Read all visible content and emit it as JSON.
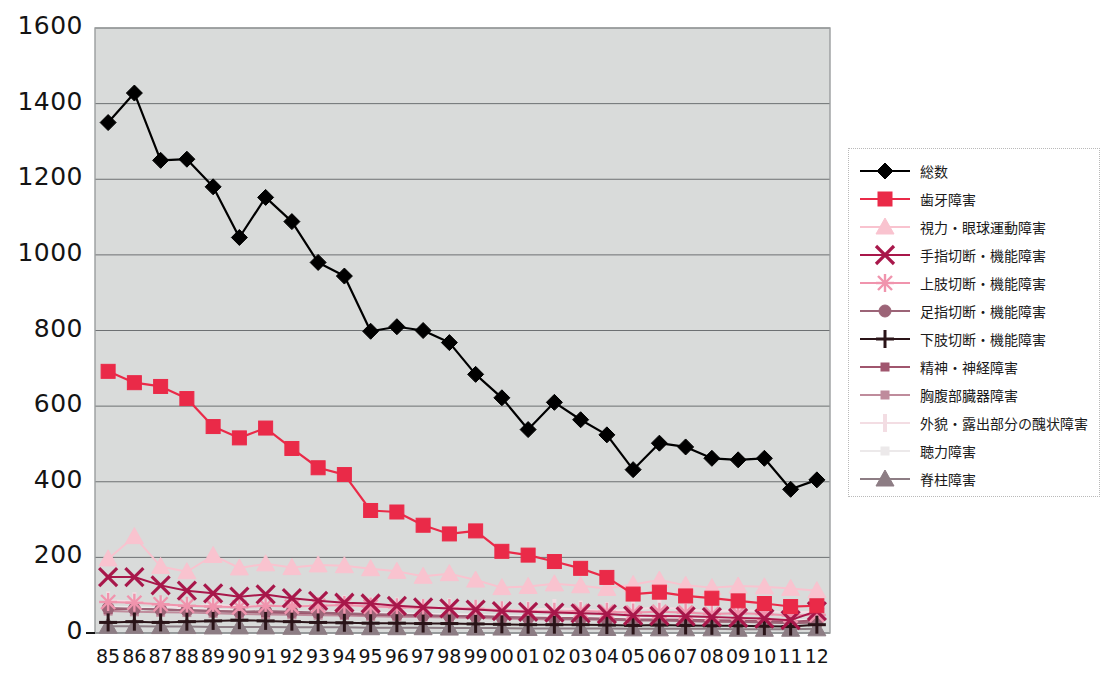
{
  "chart_data": {
    "type": "line",
    "title": "",
    "subtitle": "",
    "xlabel": "",
    "ylabel": "",
    "ylim": [
      0,
      1600
    ],
    "ytick_step": 200,
    "yticks": [
      "0",
      "200",
      "400",
      "600",
      "800",
      "1000",
      "1200",
      "1400",
      "1600"
    ],
    "grid": true,
    "legend_position": "right",
    "plot_background": "#d9dbda",
    "categories": [
      "85",
      "86",
      "87",
      "88",
      "89",
      "90",
      "91",
      "92",
      "93",
      "94",
      "95",
      "96",
      "97",
      "98",
      "99",
      "00",
      "01",
      "02",
      "03",
      "04",
      "05",
      "06",
      "07",
      "08",
      "09",
      "10",
      "11",
      "12"
    ],
    "series": [
      {
        "name": "総数",
        "color": "#000000",
        "marker": "diamond",
        "values": [
          1350,
          1428,
          1250,
          1253,
          1180,
          1046,
          1152,
          1088,
          980,
          944,
          798,
          810,
          800,
          768,
          684,
          622,
          538,
          610,
          564,
          524,
          432,
          502,
          492,
          462,
          458,
          462,
          380,
          405
        ]
      },
      {
        "name": "歯牙障害",
        "color": "#ea2a48",
        "marker": "square",
        "values": [
          692,
          662,
          652,
          620,
          546,
          516,
          542,
          488,
          437,
          419,
          324,
          320,
          285,
          262,
          270,
          216,
          206,
          189,
          171,
          147,
          103,
          108,
          98,
          92,
          85,
          78,
          70,
          72
        ]
      },
      {
        "name": "視力・眼球運動障害",
        "color": "#f9c3cf",
        "marker": "triangle",
        "values": [
          196,
          255,
          176,
          162,
          205,
          172,
          183,
          173,
          180,
          178,
          170,
          163,
          150,
          157,
          140,
          120,
          123,
          130,
          125,
          118,
          128,
          140,
          126,
          120,
          124,
          122,
          118,
          112
        ]
      },
      {
        "name": "手指切断・機能障害",
        "color": "#a8174a",
        "marker": "x",
        "values": [
          148,
          148,
          126,
          112,
          105,
          96,
          102,
          92,
          85,
          80,
          78,
          72,
          68,
          65,
          62,
          58,
          56,
          54,
          52,
          50,
          46,
          45,
          44,
          42,
          40,
          38,
          34,
          58
        ]
      },
      {
        "name": "上肢切断・機能障害",
        "color": "#f094ad",
        "marker": "asterisk",
        "values": [
          82,
          80,
          76,
          72,
          70,
          68,
          72,
          70,
          72,
          74,
          70,
          68,
          66,
          66,
          64,
          60,
          58,
          56,
          58,
          56,
          54,
          56,
          54,
          50,
          52,
          50,
          46,
          48
        ]
      },
      {
        "name": "足指切断・機能障害",
        "color": "#9c6477",
        "marker": "circle",
        "values": [
          66,
          64,
          62,
          60,
          58,
          56,
          58,
          56,
          54,
          52,
          50,
          48,
          46,
          45,
          44,
          42,
          40,
          38,
          38,
          36,
          34,
          34,
          32,
          30,
          30,
          28,
          26,
          28
        ]
      },
      {
        "name": "下肢切断・機能障害",
        "color": "#2a1418",
        "marker": "plus",
        "values": [
          28,
          30,
          28,
          30,
          32,
          34,
          32,
          30,
          28,
          27,
          26,
          26,
          25,
          25,
          24,
          23,
          22,
          22,
          22,
          21,
          20,
          21,
          20,
          19,
          19,
          18,
          17,
          22
        ]
      },
      {
        "name": "精神・神経障害",
        "color": "#a0566e",
        "marker": "small-square",
        "values": [
          62,
          64,
          62,
          60,
          58,
          56,
          54,
          53,
          52,
          50,
          48,
          47,
          46,
          45,
          44,
          42,
          41,
          40,
          40,
          38,
          36,
          36,
          35,
          34,
          33,
          32,
          30,
          34
        ]
      },
      {
        "name": "胸腹部臓器障害",
        "color": "#bf8c9c",
        "marker": "small-square",
        "values": [
          58,
          56,
          55,
          54,
          52,
          50,
          49,
          48,
          47,
          46,
          44,
          43,
          42,
          41,
          40,
          38,
          37,
          36,
          36,
          35,
          33,
          33,
          32,
          31,
          30,
          29,
          28,
          30
        ]
      },
      {
        "name": "外貌・露出部分の醜状障害",
        "color": "#f3dde3",
        "marker": "vbar",
        "values": [
          86,
          84,
          72,
          68,
          76,
          70,
          72,
          70,
          74,
          76,
          72,
          70,
          66,
          68,
          64,
          60,
          60,
          66,
          62,
          58,
          62,
          68,
          62,
          58,
          60,
          58,
          54,
          56
        ]
      },
      {
        "name": "聴力障害",
        "color": "#ece9ea",
        "marker": "small-square",
        "values": [
          70,
          68,
          66,
          64,
          62,
          60,
          58,
          57,
          56,
          55,
          54,
          52,
          50,
          50,
          48,
          46,
          45,
          44,
          44,
          42,
          40,
          40,
          39,
          38,
          37,
          36,
          34,
          36
        ]
      },
      {
        "name": "脊柱障害",
        "color": "#8d7d84",
        "marker": "triangle",
        "values": [
          18,
          18,
          17,
          17,
          16,
          16,
          16,
          15,
          15,
          15,
          14,
          14,
          14,
          13,
          13,
          13,
          12,
          12,
          12,
          12,
          11,
          11,
          11,
          11,
          10,
          10,
          10,
          11
        ]
      }
    ]
  },
  "legend": {
    "items": [
      {
        "label": "総数"
      },
      {
        "label": "歯牙障害"
      },
      {
        "label": "視力・眼球運動障害"
      },
      {
        "label": "手指切断・機能障害"
      },
      {
        "label": "上肢切断・機能障害"
      },
      {
        "label": "足指切断・機能障害"
      },
      {
        "label": "下肢切断・機能障害"
      },
      {
        "label": "精神・神経障害"
      },
      {
        "label": "胸腹部臓器障害"
      },
      {
        "label": "外貌・露出部分の醜状障害"
      },
      {
        "label": "聴力障害"
      },
      {
        "label": "脊柱障害"
      }
    ]
  }
}
